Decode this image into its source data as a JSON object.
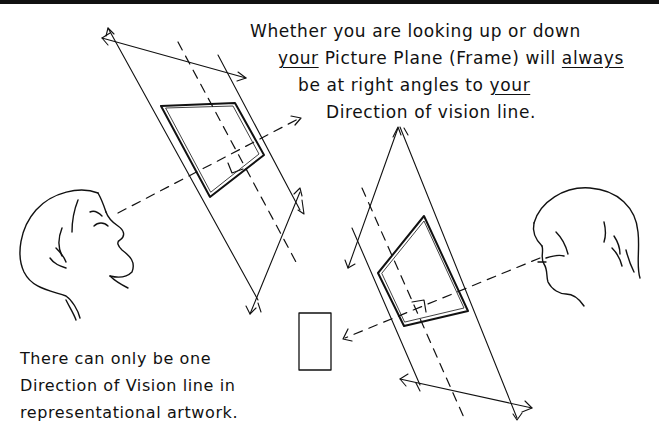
{
  "figure": {
    "type": "hand-drawn perspective diagram",
    "colors": {
      "ink": "#111111",
      "background": "#ffffff",
      "top_border": "#111111"
    }
  },
  "top_note": {
    "line1": "Whether you are looking up or down",
    "line2_a": "your",
    "line2_b": " Picture Plane (Frame) will ",
    "line2_c": "always",
    "line3_a": "be at right angles to ",
    "line3_b": "your",
    "line4": "Direction of vision line."
  },
  "bottom_note": {
    "line1": "There can only be one",
    "line2": "Direction of Vision line in",
    "line3": "representational artwork."
  },
  "elements": {
    "left_figure": "head-looking-up",
    "left_plane": "tilted-picture-plane-upper",
    "right_figure": "head-looking-down",
    "right_plane": "tilted-picture-plane-lower",
    "target_object": "small-rectangle"
  }
}
